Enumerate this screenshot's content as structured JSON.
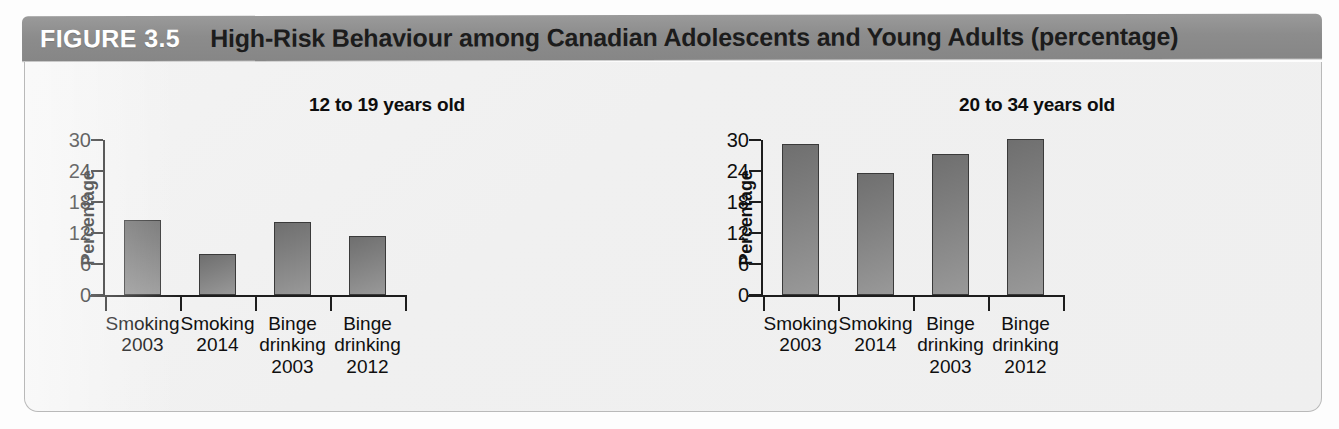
{
  "figure": {
    "number_label": "FIGURE 3.5",
    "title": "High-Risk Behaviour among Canadian Adolescents and Young Adults (percentage)",
    "header_bg": "#8c8c8c",
    "header_number_color": "#ffffff",
    "header_title_color": "#1c1c1c",
    "panel_bg": "#f0f0f0",
    "panel_border": "#b9b9b9"
  },
  "chart_data": [
    {
      "type": "bar",
      "title": "12 to 19 years old",
      "xlabel": "",
      "ylabel": "Percentage",
      "ylim": [
        0,
        30
      ],
      "yticks": [
        0,
        6,
        12,
        18,
        24,
        30
      ],
      "ytick_labels": [
        "0",
        "6",
        "12",
        "18",
        "24",
        "30"
      ],
      "grid": false,
      "legend": "none",
      "categories": [
        "Smoking 2003",
        "Smoking 2014",
        "Binge drinking 2003",
        "Binge drinking 2012"
      ],
      "category_lines": [
        [
          "Smoking",
          "2003"
        ],
        [
          "Smoking",
          "2014"
        ],
        [
          "Binge",
          "drinking",
          "2003"
        ],
        [
          "Binge",
          "drinking",
          "2012"
        ]
      ],
      "values": [
        14.5,
        8.0,
        14.2,
        11.5
      ],
      "bar_color": "#828282"
    },
    {
      "type": "bar",
      "title": "20 to 34 years old",
      "xlabel": "",
      "ylabel": "Percentage",
      "ylim": [
        0,
        30
      ],
      "yticks": [
        0,
        6,
        12,
        18,
        24,
        30
      ],
      "ytick_labels": [
        "0",
        "6",
        "12",
        "18",
        "24",
        "30"
      ],
      "grid": false,
      "legend": "none",
      "categories": [
        "Smoking 2003",
        "Smoking 2014",
        "Binge drinking 2003",
        "Binge drinking 2012"
      ],
      "category_lines": [
        [
          "Smoking",
          "2003"
        ],
        [
          "Smoking",
          "2014"
        ],
        [
          "Binge",
          "drinking",
          "2003"
        ],
        [
          "Binge",
          "drinking",
          "2012"
        ]
      ],
      "values": [
        29.3,
        23.6,
        27.3,
        30.2
      ],
      "bar_color": "#828282"
    }
  ]
}
